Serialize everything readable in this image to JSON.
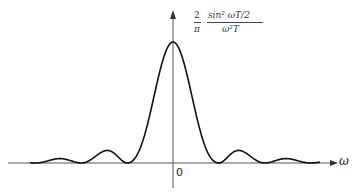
{
  "figure": {
    "y_label": {
      "coefficient_num": "2",
      "coefficient_den": "π",
      "numerator": "sin² ωT/2",
      "denominator": "ω²T"
    },
    "x_label": "ω",
    "origin_label": "0",
    "curve": "sinc-squared main lobe with decaying side lobes",
    "colors": {
      "curve": "#111111",
      "axes": "#555555",
      "background": "#ffffff"
    }
  }
}
